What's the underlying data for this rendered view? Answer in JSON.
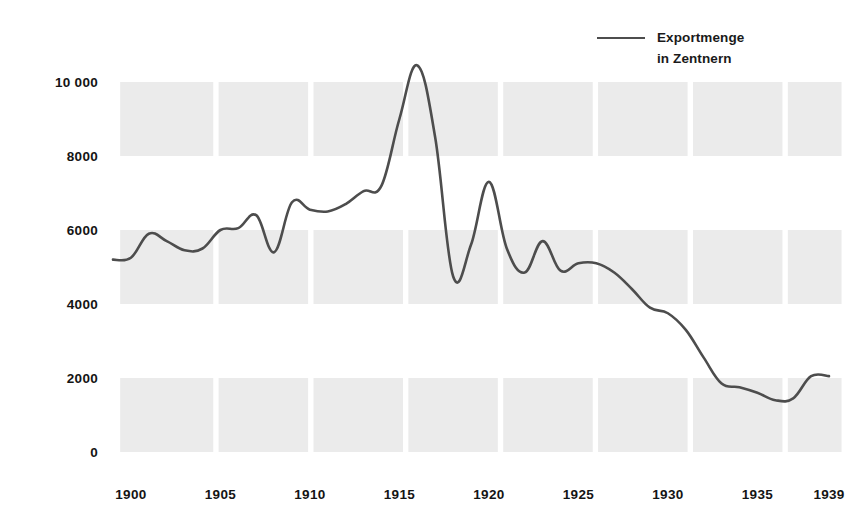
{
  "legend": {
    "line_label_1": "Exportmenge",
    "line_label_2": "in Zentnern",
    "swatch_name": "line-swatch"
  },
  "chart_data": {
    "type": "line",
    "title": "",
    "subtitle": "",
    "xlabel": "",
    "ylabel": "",
    "legend_entries": [
      "Exportmenge in Zentnern"
    ],
    "legend_position": "top-right",
    "grid": "banded",
    "band_color": "#ebebeb",
    "line_color": "#4d4d4d",
    "background": "#ffffff",
    "xlim": [
      1899,
      1939
    ],
    "ylim": [
      0,
      10800
    ],
    "ytick_labels": [
      "10 000",
      "8000",
      "6000",
      "4000",
      "2000",
      "0"
    ],
    "ytick_values": [
      10000,
      8000,
      6000,
      4000,
      2000,
      0
    ],
    "xtick_labels": [
      "1900",
      "1905",
      "1910",
      "1915",
      "1920",
      "1925",
      "1930",
      "1935",
      "1939"
    ],
    "xtick_values": [
      1900,
      1905,
      1910,
      1915,
      1920,
      1925,
      1930,
      1935,
      1939
    ],
    "y_bands": [
      [
        8000,
        10000
      ],
      [
        4000,
        6000
      ],
      [
        0,
        2000
      ]
    ],
    "x_bands": [
      [
        1899.4,
        1904.6
      ],
      [
        1904.9,
        1909.9
      ],
      [
        1910.2,
        1915.2
      ],
      [
        1915.5,
        1920.5
      ],
      [
        1920.8,
        1925.8
      ],
      [
        1926.1,
        1931.1
      ],
      [
        1931.4,
        1936.4
      ],
      [
        1936.7,
        1939.7
      ]
    ],
    "series": [
      {
        "name": "Exportmenge in Zentnern",
        "x": [
          1899,
          1900,
          1901,
          1902,
          1903,
          1904,
          1905,
          1906,
          1907,
          1908,
          1909,
          1910,
          1911,
          1912,
          1913,
          1914,
          1915,
          1916,
          1917,
          1918,
          1919,
          1920,
          1921,
          1922,
          1923,
          1924,
          1925,
          1926,
          1927,
          1928,
          1929,
          1930,
          1931,
          1932,
          1933,
          1934,
          1935,
          1936,
          1937,
          1938,
          1939
        ],
        "values": [
          5200,
          5250,
          5900,
          5700,
          5450,
          5500,
          6000,
          6050,
          6400,
          5400,
          6750,
          6550,
          6500,
          6700,
          7050,
          7200,
          9000,
          10450,
          8500,
          4750,
          5600,
          7300,
          5500,
          4850,
          5700,
          4900,
          5100,
          5100,
          4850,
          4400,
          3900,
          3750,
          3300,
          2550,
          1850,
          1750,
          1600,
          1400,
          1450,
          2050,
          2050
        ]
      }
    ]
  }
}
